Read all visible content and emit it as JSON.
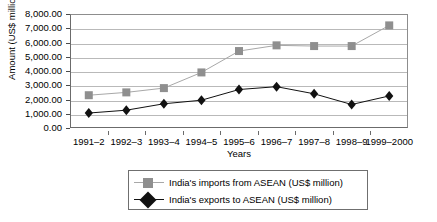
{
  "chart_data": {
    "type": "line",
    "title": "",
    "xlabel": "Years",
    "ylabel": "Amount (US$ million)",
    "categories": [
      "1991–2",
      "1992–3",
      "1993–4",
      "1994–5",
      "1995–6",
      "1996–7",
      "1997–8",
      "1998–9",
      "1999–2000"
    ],
    "ylim": [
      0,
      8000
    ],
    "ytick_labels": [
      "8,000.00",
      "7,000.00",
      "6,000.00",
      "5,000.00",
      "4,000.00",
      "3,000.00",
      "2,000.00",
      "1,000.00",
      "0.00"
    ],
    "ytick_values": [
      8000,
      7000,
      6000,
      5000,
      4000,
      3000,
      2000,
      1000,
      0
    ],
    "grid": true,
    "legend_position": "bottom",
    "series": [
      {
        "name": "India's imports from ASEAN (US$ million)",
        "marker": "square",
        "color": "#8f8f8f",
        "values": [
          2300,
          2500,
          2800,
          3900,
          5400,
          5800,
          5750,
          5750,
          7200
        ]
      },
      {
        "name": "India's exports to ASEAN (US$ million)",
        "marker": "diamond",
        "color": "#111111",
        "values": [
          1050,
          1250,
          1700,
          1950,
          2700,
          2900,
          2400,
          1650,
          2250
        ]
      }
    ]
  },
  "legend": {
    "items": [
      {
        "label": "India's imports from ASEAN (US$ million)"
      },
      {
        "label": "India's exports to ASEAN (US$ million)"
      }
    ]
  },
  "axes": {
    "y_title": "Amount (US$ million)",
    "x_title": "Years"
  },
  "colors": {
    "imports": "#8f8f8f",
    "exports": "#111111",
    "gridline": "#b9b9b9",
    "frame": "#6b6b6b",
    "background": "#ffffff"
  }
}
